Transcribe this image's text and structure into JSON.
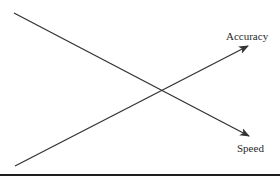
{
  "diagram": {
    "type": "tradeoff-crossing-lines",
    "line_color": "#333333",
    "text_color": "#2a2a2a",
    "lines": [
      {
        "name": "Accuracy",
        "label": "Accuracy",
        "direction": "increasing",
        "start": [
          15,
          166
        ],
        "end": [
          248,
          46
        ],
        "label_position": [
          226,
          40
        ]
      },
      {
        "name": "Speed",
        "label": "Speed",
        "direction": "decreasing",
        "start": [
          14,
          13
        ],
        "end": [
          249,
          136
        ],
        "label_position": [
          237,
          152
        ]
      }
    ],
    "intersection": [
      162,
      90
    ]
  }
}
